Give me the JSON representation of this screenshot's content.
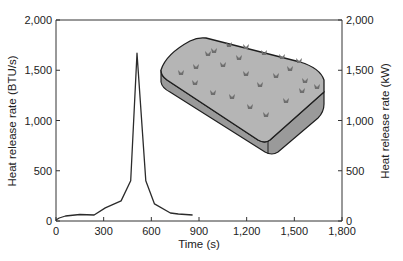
{
  "chart_data": {
    "type": "line",
    "title": "",
    "xlabel": "Time (s)",
    "ylabel": "Heat release rate (BTU/s)",
    "ylabel_right": "Heat release rate (kW)",
    "xlim": [
      0,
      1800
    ],
    "ylim": [
      0,
      2000
    ],
    "ylim_right": [
      0,
      2000
    ],
    "x_ticks": [
      0,
      300,
      600,
      900,
      1200,
      1500,
      1800
    ],
    "x_tick_labels": [
      "0",
      "300",
      "600",
      "900",
      "1,200",
      "1,500",
      "1,800"
    ],
    "y_ticks": [
      0,
      500,
      1000,
      1500,
      2000
    ],
    "y_tick_labels": [
      "0",
      "500",
      "1,000",
      "1,500",
      "2,000"
    ],
    "y_right_tick_labels": [
      "0",
      "500",
      "1,000",
      "1,500",
      "2,000"
    ],
    "grid": false,
    "legend": null,
    "series": [
      {
        "name": "Mattress heat release rate",
        "x": [
          0,
          20,
          60,
          150,
          240,
          310,
          410,
          470,
          510,
          565,
          620,
          720,
          770,
          860
        ],
        "values": [
          10,
          30,
          50,
          65,
          60,
          130,
          200,
          400,
          1670,
          400,
          170,
          80,
          70,
          60
        ]
      }
    ],
    "annotations": [
      {
        "type": "illustration",
        "label": "mattress"
      }
    ]
  },
  "colors": {
    "line": "#2b2b2b",
    "axis": "#333333",
    "mattress_fill": "#b5b5b5",
    "mattress_side": "#9a9a9a",
    "mattress_outline": "#1e1e1e",
    "tuft": "#6e6e6e"
  }
}
